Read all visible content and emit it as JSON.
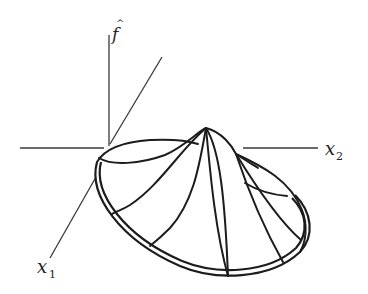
{
  "figure": {
    "type": "3d-surface-sketch",
    "axes": {
      "vertical": {
        "label": "f",
        "accent": "^"
      },
      "horizontal": {
        "label": "x",
        "subscript": "2"
      },
      "depth": {
        "label": "x",
        "subscript": "1"
      }
    },
    "colors": {
      "ink": "#1c1c1c",
      "background": "#ffffff"
    }
  }
}
